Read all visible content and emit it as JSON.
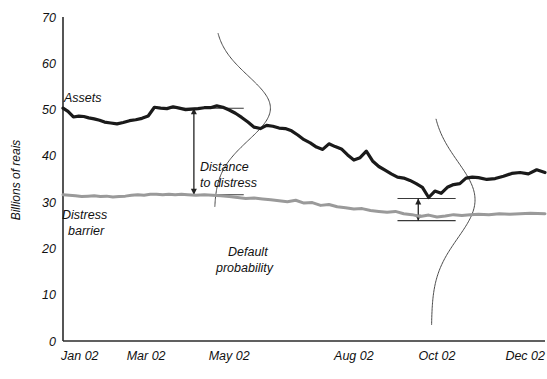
{
  "chart_data": {
    "type": "line",
    "title": "",
    "xlabel": "",
    "ylabel": "Billions of reais",
    "ylim": [
      0,
      70
    ],
    "yticks": [
      0,
      10,
      20,
      30,
      40,
      50,
      60,
      70
    ],
    "ytick_labels": [
      "0",
      "10",
      "20",
      "30",
      "40",
      "50",
      "60",
      "70"
    ],
    "grid": false,
    "legend": "inline-annotations",
    "xtick_labels": [
      "Jan 02",
      "Mar 02",
      "May 02",
      "Aug 02",
      "Oct 02",
      "Dec 02"
    ],
    "xtick_positions": [
      0,
      2,
      4,
      7,
      9,
      11
    ],
    "x_range_months": [
      0,
      11.6
    ],
    "series": [
      {
        "name": "Assets",
        "color": "#1a1a1a",
        "width": 3.2,
        "x": [
          0.0,
          0.12,
          0.25,
          0.38,
          0.5,
          0.62,
          0.75,
          0.88,
          1.0,
          1.15,
          1.3,
          1.45,
          1.6,
          1.75,
          1.9,
          2.05,
          2.2,
          2.35,
          2.5,
          2.65,
          2.8,
          2.95,
          3.1,
          3.25,
          3.4,
          3.55,
          3.7,
          3.85,
          4.0,
          4.15,
          4.3,
          4.45,
          4.6,
          4.75,
          4.9,
          5.05,
          5.2,
          5.35,
          5.5,
          5.65,
          5.8,
          5.95,
          6.1,
          6.25,
          6.4,
          6.55,
          6.7,
          6.85,
          7.0,
          7.15,
          7.3,
          7.45,
          7.6,
          7.75,
          7.9,
          8.05,
          8.2,
          8.35,
          8.5,
          8.65,
          8.8,
          8.95,
          9.1,
          9.25,
          9.4,
          9.55,
          9.7,
          9.85,
          10.0,
          10.2,
          10.4,
          10.6,
          10.8,
          11.0,
          11.2,
          11.4,
          11.6
        ],
        "y": [
          50.3,
          49.6,
          48.4,
          48.6,
          48.5,
          48.2,
          48.0,
          47.7,
          47.3,
          47.1,
          46.9,
          47.2,
          47.6,
          47.8,
          48.1,
          48.6,
          50.5,
          50.3,
          50.2,
          50.6,
          50.3,
          50.0,
          50.1,
          50.2,
          50.4,
          50.4,
          50.8,
          50.5,
          49.9,
          49.2,
          48.3,
          47.3,
          46.2,
          45.9,
          46.6,
          46.4,
          46.0,
          45.9,
          45.4,
          44.5,
          43.5,
          42.8,
          41.9,
          41.4,
          42.6,
          42.0,
          41.5,
          40.2,
          39.1,
          39.6,
          41.0,
          38.9,
          37.7,
          36.9,
          36.1,
          35.4,
          35.2,
          34.7,
          34.0,
          33.2,
          31.0,
          32.4,
          31.9,
          33.2,
          33.8,
          34.0,
          35.2,
          35.4,
          35.3,
          34.9,
          35.1,
          35.6,
          36.2,
          36.4,
          36.1,
          37.0,
          36.4
        ]
      },
      {
        "name": "Distress barrier",
        "color": "#9a9a9a",
        "width": 3.0,
        "x": [
          0.0,
          0.15,
          0.3,
          0.45,
          0.6,
          0.75,
          0.9,
          1.05,
          1.2,
          1.35,
          1.5,
          1.65,
          1.8,
          1.95,
          2.1,
          2.25,
          2.4,
          2.55,
          2.7,
          2.85,
          3.0,
          3.2,
          3.4,
          3.6,
          3.8,
          4.0,
          4.2,
          4.4,
          4.6,
          4.8,
          5.0,
          5.2,
          5.4,
          5.6,
          5.8,
          6.0,
          6.2,
          6.4,
          6.6,
          6.8,
          7.0,
          7.2,
          7.4,
          7.6,
          7.8,
          8.0,
          8.2,
          8.4,
          8.6,
          8.8,
          9.0,
          9.2,
          9.4,
          9.6,
          9.8,
          10.0,
          10.25,
          10.5,
          10.75,
          11.0,
          11.25,
          11.6
        ],
        "y": [
          31.6,
          31.5,
          31.4,
          31.2,
          31.3,
          31.4,
          31.2,
          31.3,
          31.1,
          31.2,
          31.3,
          31.5,
          31.6,
          31.5,
          31.7,
          31.7,
          31.6,
          31.7,
          31.6,
          31.7,
          31.6,
          31.5,
          31.6,
          31.5,
          31.4,
          31.2,
          31.0,
          30.8,
          30.9,
          30.7,
          30.5,
          30.3,
          30.1,
          30.4,
          29.8,
          29.9,
          29.3,
          29.5,
          29.0,
          28.8,
          28.5,
          28.6,
          28.2,
          28.0,
          27.8,
          28.0,
          27.5,
          27.3,
          26.9,
          27.2,
          26.8,
          27.0,
          27.3,
          27.1,
          27.3,
          27.4,
          27.3,
          27.5,
          27.4,
          27.5,
          27.6,
          27.5
        ]
      }
    ],
    "distributions": [
      {
        "name": "distribution-may",
        "center_x_month": 3.75,
        "center_y": 50.3,
        "top_y": 66.5,
        "bottom_y": 29.0,
        "peak_offset_months": 1.35
      },
      {
        "name": "distribution-oct",
        "center_x_month": 8.95,
        "center_y": 30.5,
        "top_y": 48.0,
        "bottom_y": 3.5,
        "peak_offset_months": 1.05
      }
    ],
    "annotations": [
      {
        "name": "assets-label",
        "text": "Assets",
        "x_px": 64,
        "y_px": 102
      },
      {
        "name": "distress-barrier-label-line1",
        "text": "Distress",
        "x_px": 62,
        "y_px": 219
      },
      {
        "name": "distress-barrier-label-line2",
        "text": "barrier",
        "x_px": 68,
        "y_px": 235
      },
      {
        "name": "distance-to-distress-label-line1",
        "text": "Distance",
        "x_px": 200,
        "y_px": 171
      },
      {
        "name": "distance-to-distress-label-line2",
        "text": "to distress",
        "x_px": 200,
        "y_px": 187
      },
      {
        "name": "default-probability-label-line1",
        "text": "Default",
        "x_px": 228,
        "y_px": 256
      },
      {
        "name": "default-probability-label-line2",
        "text": "probability",
        "x_px": 216,
        "y_px": 272
      }
    ],
    "distance_markers": [
      {
        "name": "distance-marker-may",
        "x_month": 3.15,
        "top_value": 50.3,
        "bottom_value": 31.6,
        "line_left_month": 2.55,
        "line_right_month": 4.35
      },
      {
        "name": "distance-marker-oct",
        "x_month": 8.55,
        "top_value": 30.8,
        "bottom_value": 26.0,
        "line_left_month": 8.05,
        "line_right_month": 9.45
      }
    ]
  },
  "colors": {
    "assets": "#1a1a1a",
    "barrier": "#9a9a9a",
    "axis": "#2b2b2b",
    "distribution": "#4a4a4a",
    "background": "#ffffff"
  }
}
